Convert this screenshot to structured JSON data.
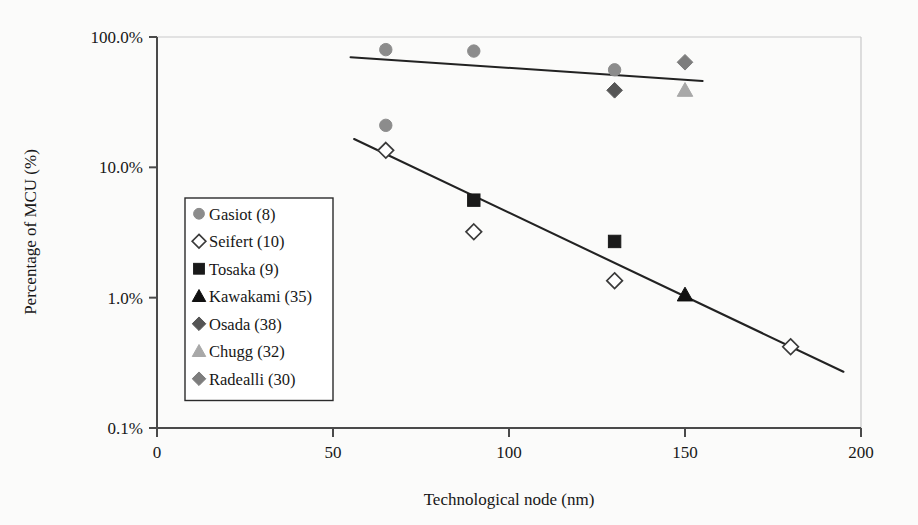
{
  "chart_data": {
    "type": "scatter",
    "title": "",
    "xlabel": "Technological node (nm)",
    "ylabel": "Percentage of MCU (%)",
    "xlim": [
      0,
      200
    ],
    "ylim": [
      0.1,
      100
    ],
    "yscale": "log",
    "xticks": [
      "0",
      "50",
      "100",
      "150",
      "200"
    ],
    "xtick_values": [
      0,
      50,
      100,
      150,
      200
    ],
    "yticks": [
      "0.1%",
      "1.0%",
      "10.0%",
      "100.0%"
    ],
    "ytick_values": [
      0.1,
      1,
      10,
      100
    ],
    "grid": "top-only",
    "legend_position": "left-middle",
    "series": [
      {
        "name": "Gasiot (8)",
        "marker": "circle",
        "fill": "#8c8c8c",
        "stroke": "#8c8c8c",
        "points": [
          {
            "x": 65,
            "y": 80
          },
          {
            "x": 90,
            "y": 78
          },
          {
            "x": 130,
            "y": 56
          },
          {
            "x": 65,
            "y": 21
          }
        ]
      },
      {
        "name": "Seifert (10)",
        "marker": "diamond-open",
        "fill": "#ffffff",
        "stroke": "#3a3a3a",
        "points": [
          {
            "x": 65,
            "y": 13.5
          },
          {
            "x": 90,
            "y": 3.2
          },
          {
            "x": 130,
            "y": 1.35
          },
          {
            "x": 180,
            "y": 0.42
          }
        ]
      },
      {
        "name": "Tosaka (9)",
        "marker": "square",
        "fill": "#1a1a1a",
        "stroke": "#1a1a1a",
        "points": [
          {
            "x": 90,
            "y": 5.6
          },
          {
            "x": 130,
            "y": 2.7
          }
        ]
      },
      {
        "name": "Kawakami (35)",
        "marker": "triangle",
        "fill": "#111111",
        "stroke": "#111111",
        "points": [
          {
            "x": 150,
            "y": 1.05
          }
        ]
      },
      {
        "name": "Osada (38)",
        "marker": "diamond",
        "fill": "#555555",
        "stroke": "#555555",
        "points": [
          {
            "x": 130,
            "y": 39
          }
        ]
      },
      {
        "name": "Chugg (32)",
        "marker": "triangle",
        "fill": "#a8a8a8",
        "stroke": "#a8a8a8",
        "points": [
          {
            "x": 150,
            "y": 39
          }
        ]
      },
      {
        "name": "Radealli (30)",
        "marker": "diamond",
        "fill": "#7d7d7d",
        "stroke": "#7d7d7d",
        "points": [
          {
            "x": 150,
            "y": 64
          }
        ]
      }
    ],
    "trendlines": [
      {
        "name": "upper-trend",
        "x0": 55,
        "y0": 70,
        "x1": 155,
        "y1": 46
      },
      {
        "name": "lower-trend",
        "x0": 56,
        "y0": 16.5,
        "x1": 195,
        "y1": 0.27
      }
    ]
  },
  "legend": {
    "items": [
      {
        "label": "Gasiot (8)",
        "marker": "circle",
        "color": "#8c8c8c"
      },
      {
        "label": "Seifert (10)",
        "marker": "diamond-open",
        "color": "#3a3a3a"
      },
      {
        "label": "Tosaka (9)",
        "marker": "square",
        "color": "#1a1a1a"
      },
      {
        "label": "Kawakami (35)",
        "marker": "triangle",
        "color": "#111111"
      },
      {
        "label": "Osada (38)",
        "marker": "diamond",
        "color": "#555555"
      },
      {
        "label": "Chugg (32)",
        "marker": "triangle",
        "color": "#a8a8a8"
      },
      {
        "label": "Radealli (30)",
        "marker": "diamond",
        "color": "#7d7d7d"
      }
    ]
  }
}
